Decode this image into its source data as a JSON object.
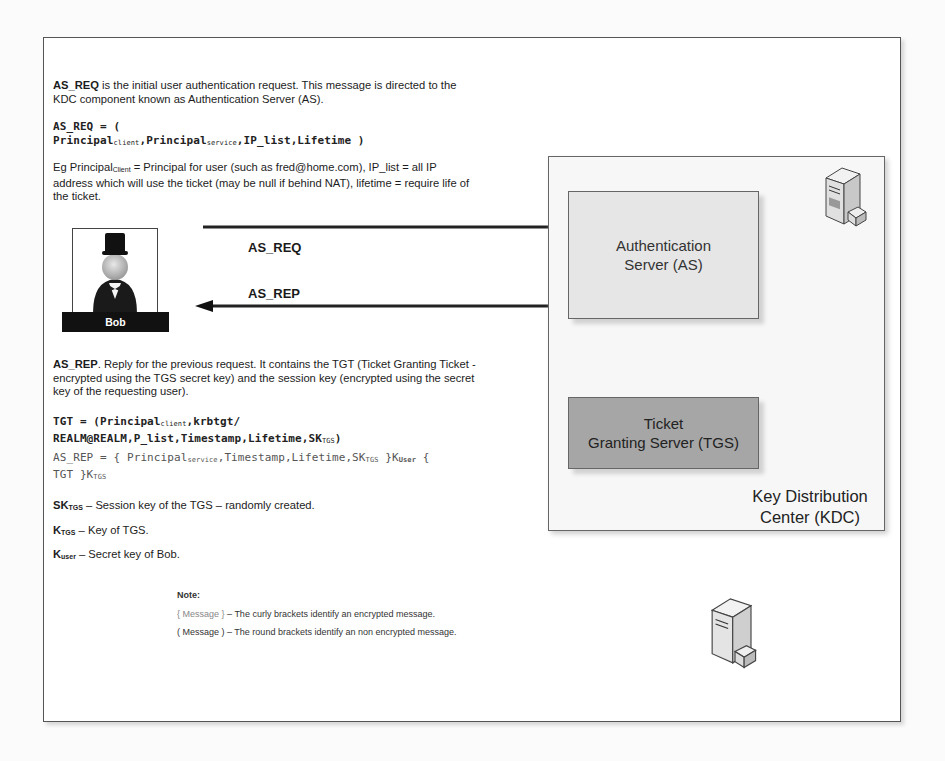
{
  "intro": {
    "term": "AS_REQ",
    "text": " is the initial user authentication request. This message is directed to the KDC component known as Authentication Server (AS)."
  },
  "as_req_formula": {
    "line1": "AS_REQ = (",
    "principal": "Principal",
    "sub_client": "client",
    "comma1": ",",
    "principal2": "Principal",
    "sub_service": "service",
    "rest": ",IP_list,Lifetime )"
  },
  "example": {
    "prefix": "Eg Principal",
    "sub": "Client",
    "text": " =  Principal for user (such as fred@home.com), IP_list = all IP address which will use the ticket (may be null if behind NAT), lifetime = require life of the ticket."
  },
  "actors": {
    "user": {
      "name": "Bob",
      "icon": "user-top-hat-icon"
    }
  },
  "arrows": [
    {
      "label": "AS_REQ",
      "direction": "right",
      "from": "Bob",
      "to": "Authentication Server (AS)"
    },
    {
      "label": "AS_REP",
      "direction": "left",
      "from": "Authentication Server (AS)",
      "to": "Bob"
    }
  ],
  "kdc": {
    "label_line1": "Key Distribution",
    "label_line2": "Center (KDC)",
    "server_icon": "server-icon",
    "as": {
      "line1": "Authentication",
      "line2": "Server (AS)"
    },
    "tgs": {
      "line1": "Ticket",
      "line2": "Granting Server (TGS)"
    }
  },
  "as_rep_desc": {
    "term": "AS_REP",
    "text": ". Reply for the previous request. It contains the TGT (Ticket Granting Ticket - encrypted using the TGS secret key) and the session key (encrypted using the secret key of the requesting user)."
  },
  "tgt_formula": {
    "prefix": "TGT = (Principal",
    "sub_client": "client",
    "line1_rest": ",krbtgt/",
    "line2": "REALM@REALM,P_list,Timestamp,Lifetime,SK",
    "sub_tgs": "TGS",
    "close": ")"
  },
  "as_rep_formula": {
    "prefix": "AS_REP = { Principal",
    "sub_service": "service",
    "mid": ",Timestamp,Lifetime,SK",
    "sub_tgs": "TGS",
    "close1": " }K",
    "sub_user": "User",
    "open2": " {",
    "line2": "TGT }K",
    "sub_tgs2": "TGS"
  },
  "definitions": [
    {
      "term": "SK",
      "sub": "TGS",
      "text": " – Session key of the TGS – randomly created."
    },
    {
      "term": "K",
      "sub": "TGS",
      "text": " – Key of TGS."
    },
    {
      "term": "K",
      "sub": "user",
      "text": " – Secret key of Bob."
    }
  ],
  "note": {
    "title": "Note:",
    "items": [
      {
        "bracket": "{ Message }",
        "text": " – The curly brackets identify an encrypted message."
      },
      {
        "bracket": "( Message )",
        "text": " – The round brackets identify an non encrypted message."
      }
    ]
  },
  "colors": {
    "as_fill": "#e6e6e6",
    "tgs_fill": "#a6a6a6",
    "kdc_fill": "#f7f7f7",
    "bob_label_bg": "#111111"
  }
}
